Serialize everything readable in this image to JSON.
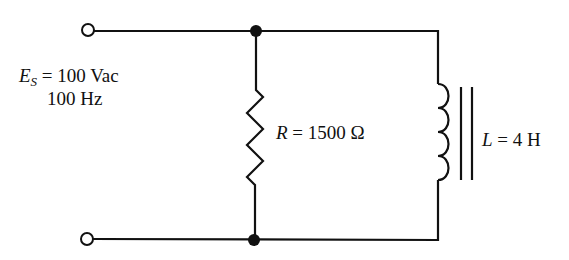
{
  "source": {
    "symbol": "E",
    "subscript": "S",
    "voltage_text": "= 100 Vac",
    "frequency_text": "100 Hz"
  },
  "resistor": {
    "symbol": "R",
    "value_text": "= 1500 Ω"
  },
  "inductor": {
    "symbol": "L",
    "value_text": "= 4 H"
  },
  "colors": {
    "wire": "#111111",
    "background": "#ffffff"
  }
}
